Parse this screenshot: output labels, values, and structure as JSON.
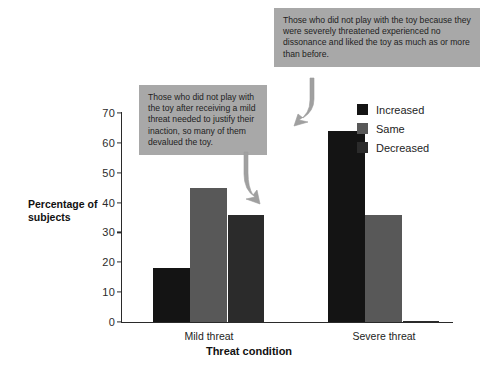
{
  "chart_data": {
    "type": "bar",
    "title": "",
    "xlabel": "Threat condition",
    "ylabel": "Percentage of subjects",
    "categories": [
      "Mild threat",
      "Severe threat"
    ],
    "series": [
      {
        "name": "Increased",
        "color": "#141414",
        "values": [
          18,
          64
        ]
      },
      {
        "name": "Same",
        "color": "#585858",
        "values": [
          45,
          36
        ]
      },
      {
        "name": "Decreased",
        "color": "#2b2b2b",
        "values": [
          36,
          0.5
        ]
      }
    ],
    "ylim": [
      0,
      70
    ],
    "yticks": [
      0,
      10,
      20,
      30,
      40,
      50,
      60,
      70
    ],
    "ytick_labels": [
      "0",
      "10",
      "20",
      "30",
      "40",
      "50",
      "60",
      "70"
    ],
    "grid": false,
    "legend_position": "upper right"
  },
  "legend": {
    "items": [
      {
        "label": "Increased",
        "color": "#141414"
      },
      {
        "label": "Same",
        "color": "#585858"
      },
      {
        "label": "Decreased",
        "color": "#2b2b2b"
      }
    ]
  },
  "axes": {
    "y_title": "Percentage of subjects",
    "y_title_line1": "Percentage of",
    "y_title_line2": "subjects",
    "x_title": "Threat condition",
    "x_labels": [
      "Mild threat",
      "Severe threat"
    ]
  },
  "callouts": [
    {
      "id": "severe-threat-callout",
      "text": "Those who did not play with the toy because they were severely threatened experienced no dissonance and liked the toy as much as or more than before."
    },
    {
      "id": "mild-threat-callout",
      "text": "Those who did not play with the toy after receiving a mild threat needed to justify their inaction, so many of them devalued the toy."
    }
  ]
}
